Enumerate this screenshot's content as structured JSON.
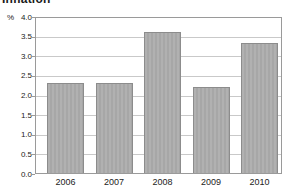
{
  "page": {
    "title": "Inflation"
  },
  "chart_data": {
    "type": "bar",
    "title": "Inflation",
    "unit_label": "%",
    "categories": [
      "2006",
      "2007",
      "2008",
      "2009",
      "2010"
    ],
    "values": [
      2.3,
      2.3,
      3.6,
      2.2,
      3.3
    ],
    "xlabel": "",
    "ylabel": "%",
    "ylim": [
      0.0,
      4.0
    ],
    "ytick_step": 0.5,
    "ytick_labels": [
      "4.0",
      "3.5",
      "3.0",
      "2.5",
      "2.0",
      "1.5",
      "1.0",
      "0.5",
      "0.0"
    ],
    "grid": true,
    "legend": false,
    "colors": {
      "bar_fill": "#ababab",
      "bar_border": "#8c8c8c",
      "plot_border": "#9a9a9a",
      "gridline": "#c9c9c9",
      "text": "#222222",
      "title_text": "#1a1a1a",
      "background": "#ffffff"
    }
  }
}
